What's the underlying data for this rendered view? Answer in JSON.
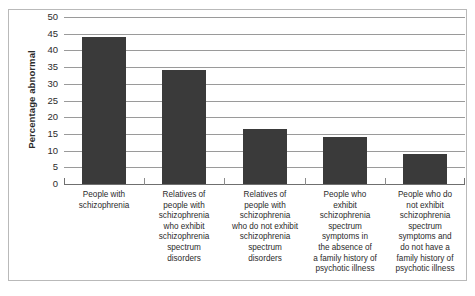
{
  "chart_data": {
    "type": "bar",
    "title": "",
    "xlabel": "",
    "ylabel": "Percentage abnormal",
    "ylim": [
      0,
      50
    ],
    "ytick_step": 5,
    "yticks": [
      0,
      5,
      10,
      15,
      20,
      25,
      30,
      35,
      40,
      45,
      50
    ],
    "grid": true,
    "legend": null,
    "bar_color": "#3a3a3a",
    "categories": [
      "People with schizophrenia",
      "Relatives of people with schizophrenia who exhibit schizophrenia spectrum disorders",
      "Relatives of people with schizophrenia who do not exhibit schizophrenia spectrum disorders",
      "People who exhibit schizophrenia spectrum symptoms in the absence of a family history of psychotic illness",
      "People who do not exhibit schizophrenia spectrum symptoms and do not have a family history of psychotic illness"
    ],
    "category_lines": [
      [
        "People with",
        "schizophrenia"
      ],
      [
        "Relatives of",
        "people with",
        "schizophrenia",
        "who exhibit",
        "schizophrenia",
        "spectrum",
        "disorders"
      ],
      [
        "Relatives of",
        "people with",
        "schizophrenia",
        "who do not exhibit",
        "schizophrenia",
        "spectrum",
        "disorders"
      ],
      [
        "People who",
        "exhibit",
        "schizophrenia",
        "spectrum",
        "symptoms in",
        "the absence of",
        "a family history of",
        "psychotic illness"
      ],
      [
        "People who do",
        "not exhibit",
        "schizophrenia",
        "spectrum",
        "symptoms and",
        "do not have a",
        "family history of",
        "psychotic illness"
      ]
    ],
    "values": [
      44,
      34,
      16.5,
      14,
      9
    ]
  }
}
